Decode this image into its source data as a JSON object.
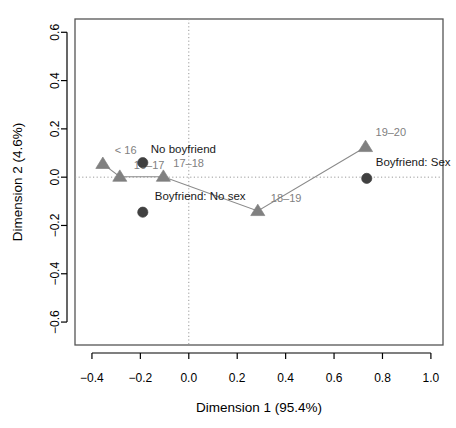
{
  "chart_data": {
    "type": "scatter",
    "title": "",
    "xlabel": "Dimension 1 (95.4%)",
    "ylabel": "Dimension 2 (4.6%)",
    "xlim": [
      -0.47,
      1.05
    ],
    "ylim": [
      -0.695,
      0.655
    ],
    "xticks": [
      -0.4,
      -0.2,
      0.0,
      0.2,
      0.4,
      0.6,
      0.8,
      1.0
    ],
    "xticklabels": [
      "-0.4",
      "-0.2",
      "0.0",
      "0.2",
      "0.4",
      "0.6",
      "0.8",
      "1.0"
    ],
    "yticks": [
      -0.6,
      -0.4,
      -0.2,
      0.0,
      0.2,
      0.4,
      0.6
    ],
    "yticklabels": [
      "-0.6",
      "-0.4",
      "-0.2",
      "0.0",
      "0.2",
      "0.4",
      "0.6"
    ],
    "grid": false,
    "reference_lines": {
      "horizontal_at": 0.0,
      "vertical_at": 0.0,
      "style": "dotted",
      "color": "#999999"
    },
    "legend_position": "none",
    "series": [
      {
        "name": "Age group trajectory",
        "marker": "triangle",
        "color": "#808080",
        "connected": true,
        "line_color": "#8a8a8a",
        "label_color": "#808080",
        "points": [
          {
            "label": "< 16",
            "x": -0.355,
            "y": 0.055,
            "label_dx": 12,
            "label_dy": -10
          },
          {
            "label": "16-17",
            "x": -0.285,
            "y": 0.002,
            "label_dx": 14,
            "label_dy": -8
          },
          {
            "label": "17-18",
            "x": -0.105,
            "y": 0.002,
            "label_dx": 10,
            "label_dy": -10
          },
          {
            "label": "18-19",
            "x": 0.285,
            "y": -0.14,
            "label_dx": 13,
            "label_dy": -9
          },
          {
            "label": "19-20",
            "x": 0.73,
            "y": 0.125,
            "label_dx": 10,
            "label_dy": -11
          }
        ]
      },
      {
        "name": "Boyfriend status",
        "marker": "circle",
        "color": "#404040",
        "connected": false,
        "label_color": "#1a1a1a",
        "points": [
          {
            "label": "No boyfriend",
            "x": -0.19,
            "y": 0.06,
            "label_dx": 8,
            "label_dy": -10
          },
          {
            "label": "Boyfriend: No sex",
            "x": -0.19,
            "y": -0.145,
            "label_dx": 12,
            "label_dy": -12
          },
          {
            "label": "Boyfriend: Sex",
            "x": 0.735,
            "y": -0.005,
            "label_dx": 9,
            "label_dy": -12
          }
        ]
      }
    ]
  }
}
